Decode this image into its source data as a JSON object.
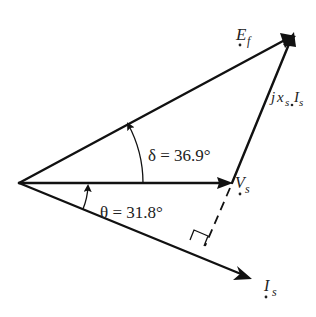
{
  "diagram": {
    "type": "phasor-diagram",
    "origin": {
      "x": 19,
      "y": 183
    },
    "phasors": [
      {
        "name": "E_f",
        "label": "E",
        "sub": "f",
        "tip": {
          "x": 292,
          "y": 37
        }
      },
      {
        "name": "V_s",
        "label": "V",
        "sub": "s",
        "tip": {
          "x": 232,
          "y": 183
        }
      },
      {
        "name": "I_s",
        "label": "I",
        "sub": "s",
        "tip": {
          "x": 252,
          "y": 279
        }
      }
    ],
    "segments": [
      {
        "name": "jx_s I_s",
        "from": "V_s",
        "to": "E_f",
        "style": "solid"
      },
      {
        "name": "projection",
        "from": "V_s",
        "to": "I_s-line",
        "style": "dashed"
      }
    ],
    "labels": {
      "ef_main": "E",
      "ef_sub": "f",
      "vs_main": "V",
      "vs_sub": "s",
      "is_main": "I",
      "is_sub": "s",
      "jx_j": "j",
      "jx_x": "x",
      "jx_xsub": "s",
      "jx_I": "I",
      "jx_Isub": "s",
      "delta": "δ = 36.9°",
      "theta": "θ = 31.8°"
    },
    "angles": {
      "delta_deg": 36.9,
      "theta_deg": 31.8
    },
    "colors": {
      "stroke": "#111111",
      "text": "#222222",
      "background": "#ffffff"
    }
  }
}
